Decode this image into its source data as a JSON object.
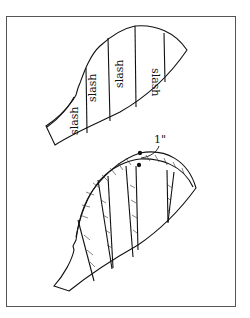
{
  "figure": {
    "upper_piece": {
      "description": "sleeve cap pattern with slash lines",
      "slash_labels": [
        "slash",
        "slash",
        "slash",
        "slash"
      ]
    },
    "lower_piece": {
      "description": "spread sleeve cap with hatched added area",
      "annotation": "1\""
    }
  }
}
